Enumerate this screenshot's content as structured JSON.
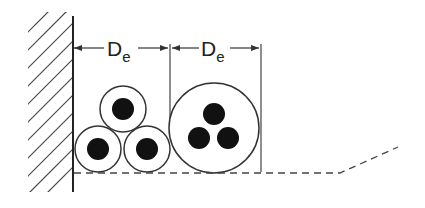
{
  "diagram": {
    "labels": {
      "dim1_main": "D",
      "dim1_sub": "e",
      "dim2_main": "D",
      "dim2_sub": "e"
    },
    "colors": {
      "stroke": "#333333",
      "conductor": "#111111",
      "background": "#ffffff"
    }
  }
}
